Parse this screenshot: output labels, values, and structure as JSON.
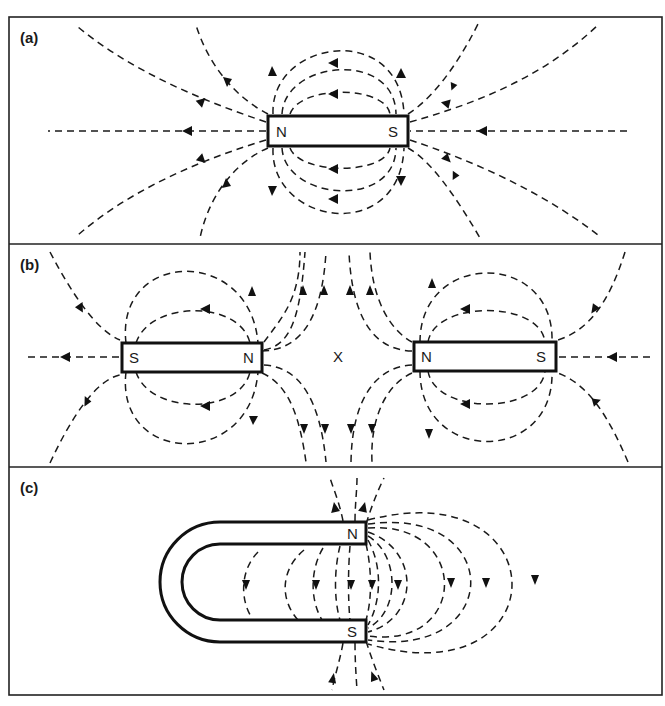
{
  "figure": {
    "colors": {
      "ink": "#1a1a1a",
      "background": "#ffffff"
    },
    "panels": [
      {
        "id": "a",
        "label": "(a)",
        "description": "Single bar magnet",
        "magnets": [
          {
            "type": "bar",
            "left_pole": "N",
            "right_pole": "S"
          }
        ]
      },
      {
        "id": "b",
        "label": "(b)",
        "description": "Two bar magnets with like (N) poles facing; neutral point between them",
        "magnets": [
          {
            "type": "bar",
            "left_pole": "S",
            "right_pole": "N"
          },
          {
            "type": "bar",
            "left_pole": "N",
            "right_pole": "S"
          }
        ],
        "neutral_point_label": "X"
      },
      {
        "id": "c",
        "label": "(c)",
        "description": "Horseshoe magnet",
        "magnets": [
          {
            "type": "horseshoe",
            "top_pole": "N",
            "bottom_pole": "S"
          }
        ]
      }
    ]
  }
}
